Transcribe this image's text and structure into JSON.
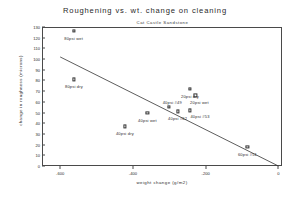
{
  "chart_data": {
    "type": "scatter",
    "title": "Roughening vs. wt. change on cleaning",
    "subtitle": "Cat Castle Sandstone",
    "xlabel": "weight change (g/m2)",
    "ylabel": "change in roughness (microns)",
    "xlim": [
      -650,
      10
    ],
    "ylim": [
      0,
      130
    ],
    "xticks": [
      -600,
      -400,
      -200,
      0
    ],
    "yticks": [
      0,
      10,
      20,
      30,
      40,
      50,
      60,
      70,
      80,
      90,
      100,
      110,
      120,
      130
    ],
    "grid": false,
    "legend": "none",
    "points": [
      {
        "label": "80psi wet",
        "x": -563,
        "y": 126,
        "label_dx": 0,
        "label_dy": 5
      },
      {
        "label": "80psi dry",
        "x": -562,
        "y": 81,
        "label_dx": 0,
        "label_dy": 5
      },
      {
        "label": "40psi dry",
        "x": -422,
        "y": 37,
        "label_dx": 0,
        "label_dy": 5
      },
      {
        "label": "40psi wet",
        "x": -360,
        "y": 50,
        "label_dx": 0,
        "label_dy": 5
      },
      {
        "label": "40psi #49",
        "x": -300,
        "y": 55,
        "label_dx": 3,
        "label_dy": -7
      },
      {
        "label": "40psi #62",
        "x": -277,
        "y": 51,
        "label_dx": 0,
        "label_dy": 5
      },
      {
        "label": "40psi #53",
        "x": -243,
        "y": 52,
        "label_dx": 10,
        "label_dy": 4
      },
      {
        "label": "20psi dry",
        "x": -243,
        "y": 72,
        "label_dx": 0,
        "label_dy": 5
      },
      {
        "label": "20psi wet",
        "x": -228,
        "y": 66,
        "label_dx": 4,
        "label_dy": 5
      },
      {
        "label": "60psi #51",
        "x": -85,
        "y": 18,
        "label_dx": 0,
        "label_dy": 5
      }
    ],
    "trendline": {
      "x0": -600,
      "y0": 102,
      "x1": 0,
      "y1": 0,
      "style": "solid",
      "color": "#333333"
    }
  }
}
